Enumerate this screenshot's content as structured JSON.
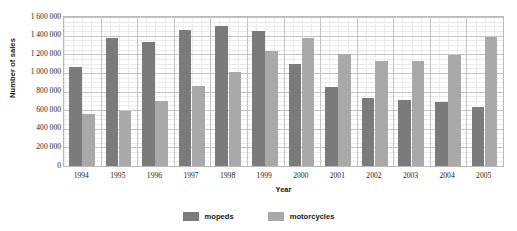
{
  "chart_data": {
    "type": "bar",
    "title": "",
    "xlabel": "Year",
    "ylabel": "Number of sales",
    "categories": [
      "1994",
      "1995",
      "1996",
      "1997",
      "1998",
      "1999",
      "2000",
      "2001",
      "2002",
      "2003",
      "2004",
      "2005"
    ],
    "series": [
      {
        "name": "mopeds",
        "color": "#7b7b7b",
        "values": [
          1060000,
          1370000,
          1335000,
          1460000,
          1505000,
          1450000,
          1100000,
          850000,
          730000,
          710000,
          690000,
          630000
        ]
      },
      {
        "name": "motorcycles",
        "color": "#a9a9a9",
        "values": [
          560000,
          595000,
          700000,
          860000,
          1010000,
          1230000,
          1370000,
          1200000,
          1130000,
          1130000,
          1195000,
          1385000
        ]
      }
    ],
    "ylim": [
      0,
      1600000
    ],
    "ytick_values": [
      1600000,
      1400000,
      1200000,
      1000000,
      800000,
      600000,
      400000,
      200000,
      0
    ],
    "ytick_labels": [
      "1 600 000",
      "1 400 000",
      "1 200 000",
      "1 000 000",
      "800 000",
      "600 000",
      "400 000",
      "200 000",
      "0"
    ],
    "grid": true,
    "legend_position": "bottom"
  },
  "legend": {
    "items": [
      {
        "label": "mopeds"
      },
      {
        "label": "motorcycles"
      }
    ]
  },
  "clipped_title": ""
}
